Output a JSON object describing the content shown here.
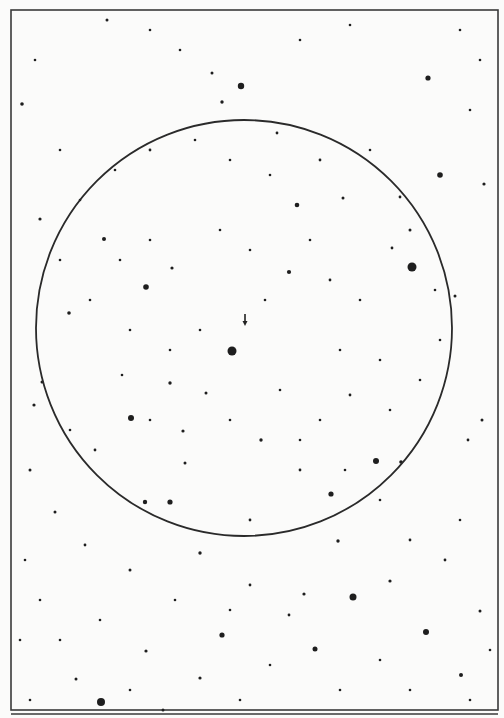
{
  "chart": {
    "type": "star_finder_chart",
    "frame": {
      "x": 11,
      "y": 10,
      "w": 487,
      "h": 700
    },
    "lower_frame_top": 714,
    "colors": {
      "background": "#fbfbfa",
      "ink": "#1e1e1e",
      "frame": "#3a3a3a"
    },
    "fov_circle": {
      "cx": 244,
      "cy": 328,
      "r": 208
    },
    "target_marker": {
      "x": 245,
      "y": 322,
      "direction": "down"
    },
    "stars": [
      [
        232,
        351,
        4.5
      ],
      [
        412,
        267,
        4.5
      ],
      [
        241,
        86,
        3.2
      ],
      [
        440,
        175,
        2.8
      ],
      [
        428,
        78,
        2.6
      ],
      [
        131,
        418,
        3
      ],
      [
        376,
        461,
        3
      ],
      [
        331,
        494,
        2.6
      ],
      [
        353,
        597,
        3.5
      ],
      [
        146,
        287,
        2.8
      ],
      [
        170,
        502,
        2.6
      ],
      [
        101,
        702,
        4
      ],
      [
        426,
        632,
        3
      ],
      [
        222,
        635,
        2.6
      ],
      [
        315,
        649,
        2.5
      ],
      [
        297,
        205,
        2.3
      ],
      [
        289,
        272,
        2.1
      ],
      [
        22,
        104,
        1.8
      ],
      [
        69,
        313,
        1.8
      ],
      [
        104,
        239,
        2
      ],
      [
        455,
        296,
        1.5
      ],
      [
        145,
        502,
        2.2
      ],
      [
        40,
        219,
        1.6
      ],
      [
        172,
        268,
        1.6
      ],
      [
        170,
        383,
        1.7
      ],
      [
        185,
        463,
        1.5
      ],
      [
        261,
        440,
        1.7
      ],
      [
        401,
        462,
        1.8
      ],
      [
        200,
        553,
        1.7
      ],
      [
        304,
        594,
        1.6
      ],
      [
        338,
        541,
        1.7
      ],
      [
        390,
        581,
        1.6
      ],
      [
        461,
        675,
        2
      ],
      [
        200,
        678,
        1.6
      ],
      [
        163,
        710,
        1.5
      ],
      [
        146,
        651,
        1.6
      ],
      [
        76,
        679,
        1.5
      ],
      [
        107,
        20,
        1.5
      ],
      [
        212,
        73,
        1.5
      ],
      [
        222,
        102,
        1.7
      ],
      [
        277,
        133,
        1.4
      ],
      [
        343,
        198,
        1.5
      ],
      [
        400,
        197,
        1.4
      ],
      [
        484,
        184,
        1.6
      ],
      [
        42,
        382,
        1.5
      ],
      [
        34,
        405,
        1.6
      ],
      [
        30,
        470,
        1.5
      ],
      [
        482,
        420,
        1.5
      ],
      [
        468,
        440,
        1.4
      ],
      [
        55,
        512,
        1.5
      ],
      [
        85,
        545,
        1.4
      ],
      [
        130,
        570,
        1.5
      ],
      [
        250,
        585,
        1.4
      ],
      [
        289,
        615,
        1.4
      ],
      [
        410,
        540,
        1.4
      ],
      [
        480,
        611,
        1.5
      ],
      [
        445,
        560,
        1.4
      ],
      [
        460,
        520,
        1.3
      ],
      [
        380,
        500,
        1.3
      ],
      [
        250,
        520,
        1.4
      ],
      [
        300,
        470,
        1.4
      ],
      [
        206,
        393,
        1.5
      ],
      [
        183,
        431,
        1.6
      ],
      [
        150,
        420,
        1.3
      ],
      [
        122,
        375,
        1.3
      ],
      [
        95,
        450,
        1.4
      ],
      [
        70,
        430,
        1.3
      ],
      [
        320,
        420,
        1.3
      ],
      [
        350,
        395,
        1.4
      ],
      [
        390,
        410,
        1.3
      ],
      [
        420,
        380,
        1.3
      ],
      [
        440,
        340,
        1.3
      ],
      [
        360,
        300,
        1.3
      ],
      [
        330,
        280,
        1.4
      ],
      [
        265,
        300,
        1.3
      ],
      [
        200,
        330,
        1.3
      ],
      [
        170,
        350,
        1.3
      ],
      [
        130,
        330,
        1.3
      ],
      [
        90,
        300,
        1.3
      ],
      [
        60,
        260,
        1.3
      ],
      [
        80,
        200,
        1.3
      ],
      [
        115,
        170,
        1.3
      ],
      [
        150,
        150,
        1.4
      ],
      [
        195,
        140,
        1.3
      ],
      [
        230,
        160,
        1.3
      ],
      [
        270,
        175,
        1.3
      ],
      [
        320,
        160,
        1.4
      ],
      [
        370,
        150,
        1.3
      ],
      [
        410,
        230,
        1.5
      ],
      [
        392,
        248,
        1.4
      ],
      [
        435,
        290,
        1.3
      ],
      [
        60,
        150,
        1.3
      ],
      [
        35,
        60,
        1.3
      ],
      [
        150,
        30,
        1.3
      ],
      [
        180,
        50,
        1.3
      ],
      [
        300,
        40,
        1.3
      ],
      [
        350,
        25,
        1.3
      ],
      [
        460,
        30,
        1.3
      ],
      [
        480,
        60,
        1.3
      ],
      [
        470,
        110,
        1.3
      ],
      [
        25,
        560,
        1.3
      ],
      [
        40,
        600,
        1.3
      ],
      [
        20,
        640,
        1.3
      ],
      [
        60,
        640,
        1.3
      ],
      [
        100,
        620,
        1.3
      ],
      [
        175,
        600,
        1.3
      ],
      [
        230,
        610,
        1.3
      ],
      [
        270,
        665,
        1.3
      ],
      [
        340,
        690,
        1.3
      ],
      [
        380,
        660,
        1.3
      ],
      [
        410,
        690,
        1.3
      ],
      [
        470,
        700,
        1.3
      ],
      [
        490,
        650,
        1.3
      ],
      [
        240,
        700,
        1.3
      ],
      [
        130,
        690,
        1.3
      ],
      [
        30,
        700,
        1.3
      ],
      [
        220,
        230,
        1.3
      ],
      [
        250,
        250,
        1.3
      ],
      [
        310,
        240,
        1.3
      ],
      [
        150,
        240,
        1.3
      ],
      [
        120,
        260,
        1.3
      ],
      [
        340,
        350,
        1.3
      ],
      [
        380,
        360,
        1.3
      ],
      [
        280,
        390,
        1.3
      ],
      [
        230,
        420,
        1.3
      ],
      [
        300,
        440,
        1.3
      ],
      [
        345,
        470,
        1.3
      ]
    ]
  }
}
